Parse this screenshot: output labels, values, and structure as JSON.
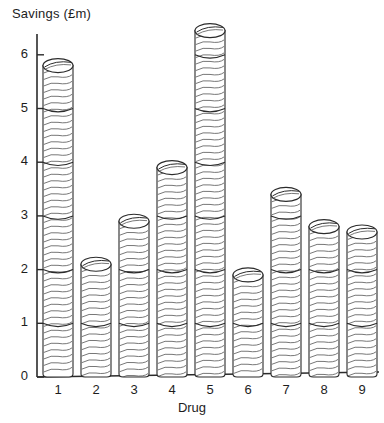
{
  "chart_data": {
    "type": "bar",
    "title": "",
    "subtitle": "",
    "xlabel": "Drug",
    "ylabel": "Savings (£m)",
    "categories": [
      "1",
      "2",
      "3",
      "4",
      "5",
      "6",
      "7",
      "8",
      "9"
    ],
    "values": [
      5.8,
      2.1,
      2.9,
      3.9,
      6.45,
      1.9,
      3.4,
      2.8,
      2.7
    ],
    "series": [
      {
        "name": "Savings",
        "values": [
          5.8,
          2.1,
          2.9,
          3.9,
          6.45,
          1.9,
          3.4,
          2.8,
          2.7
        ]
      }
    ],
    "ylim": [
      0,
      6.6
    ],
    "yticks": [
      0,
      1,
      2,
      3,
      4,
      5,
      6
    ],
    "ytick_labels": [
      "0",
      "1",
      "2",
      "3",
      "4",
      "5",
      "6"
    ],
    "xtick_labels": [
      "1",
      "2",
      "3",
      "4",
      "5",
      "6",
      "7",
      "8",
      "9"
    ],
    "grid": false,
    "legend": "none",
    "style": "3d-cylinder-hand-drawn",
    "bar_fill": "#ffffff",
    "bar_stroke": "#2b2b2b",
    "axis_color": "#2b2b2b",
    "background": "#ffffff"
  },
  "axes": {
    "y_axis_label": "Savings (£m)",
    "x_axis_label": "Drug"
  }
}
